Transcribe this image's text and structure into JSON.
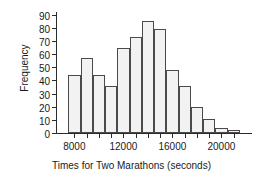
{
  "chart_data": {
    "type": "bar",
    "title": "",
    "subtitle": "",
    "xlabel": "Times for Two Marathons (seconds)",
    "ylabel": "Frequency",
    "xlim": [
      6500,
      22500
    ],
    "ylim": [
      0,
      92
    ],
    "grid": false,
    "legend": null,
    "bin_width": 1000,
    "bin_starts": [
      7500,
      8500,
      9500,
      10500,
      11500,
      12500,
      13500,
      14500,
      15500,
      16500,
      17500,
      18500,
      19500,
      20500
    ],
    "categories": [
      "7500-8500",
      "8500-9500",
      "9500-10500",
      "10500-11500",
      "11500-12500",
      "12500-13500",
      "13500-14500",
      "14500-15500",
      "15500-16500",
      "16500-17500",
      "17500-18500",
      "18500-19500",
      "19500-20500",
      "20500-21500"
    ],
    "values": [
      44,
      57,
      44,
      36,
      65,
      73,
      85,
      79,
      48,
      36,
      20,
      11,
      4,
      2
    ],
    "y_ticks": [
      0,
      10,
      20,
      30,
      40,
      50,
      60,
      70,
      80,
      90
    ],
    "y_tick_labels": [
      "0",
      "10",
      "20",
      "30",
      "40",
      "50",
      "60",
      "70",
      "80",
      "90"
    ],
    "x_ticks": [
      8000,
      12000,
      16000,
      20000
    ],
    "x_tick_labels": [
      "8000",
      "12000",
      "16000",
      "20000"
    ],
    "x_minor_ticks": [
      8000,
      9000,
      10000,
      11000,
      12000,
      13000,
      14000,
      15000,
      16000,
      17000,
      18000,
      19000,
      20000,
      21000
    ],
    "bar_fill_color": "#f2f2f2",
    "bar_edge_color": "#4a4a4a",
    "axis_color": "#2b2b2b",
    "text_color": "#1a1a1a",
    "background_color": "#ffffff"
  }
}
